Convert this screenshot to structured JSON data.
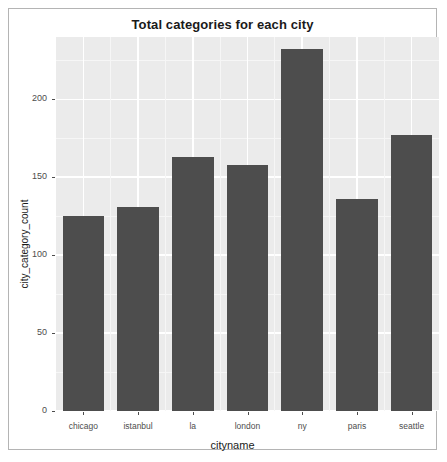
{
  "chart_data": {
    "type": "bar",
    "title": "Total categories for each city",
    "xlabel": "cityname",
    "ylabel": "city_category_count",
    "categories": [
      "chicago",
      "istanbul",
      "la",
      "london",
      "ny",
      "paris",
      "seattle"
    ],
    "values": [
      125,
      131,
      163,
      158,
      232,
      136,
      177
    ],
    "ylim": [
      0,
      240
    ],
    "yticks": [
      0,
      50,
      100,
      150,
      200
    ],
    "ytick_labels": [
      "0",
      "50",
      "100",
      "150",
      "200"
    ],
    "grid": true,
    "grid_minor": true,
    "legend": "none",
    "colors": {
      "bar": "#4d4d4d",
      "panel_background": "#ebebeb",
      "gridline_major": "#ffffff",
      "gridline_minor": "#f6f6f6",
      "text": "#1a1a1a",
      "tick_text": "#4d4d4d",
      "frame_border": "#b4b4b4"
    }
  }
}
